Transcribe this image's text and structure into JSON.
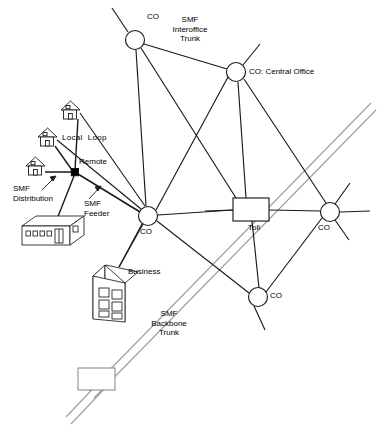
{
  "diagram": {
    "colors": {
      "line": "#1a1a1a",
      "backbone": "#9a9a9a",
      "node_fill": "#ffffff",
      "remote_fill": "#000000",
      "background": "#ffffff",
      "text": "#000000"
    },
    "nodes": [
      {
        "id": "co_top",
        "type": "co-circle",
        "label": "CO",
        "cx": 135,
        "cy": 40,
        "r": 9.5,
        "label_x": 147,
        "label_y": 17,
        "align": "left"
      },
      {
        "id": "co_central",
        "type": "co-circle",
        "label": "CO: Central Office",
        "cx": 236,
        "cy": 72,
        "r": 9.5,
        "label_x": 249,
        "label_y": 67,
        "align": "left"
      },
      {
        "id": "co_left",
        "type": "co-circle",
        "label": "CO",
        "cx": 148,
        "cy": 216,
        "r": 9.5,
        "label_x": 140,
        "label_y": 228,
        "align": "left"
      },
      {
        "id": "co_right",
        "type": "co-circle",
        "label": "CO",
        "cx": 330,
        "cy": 212,
        "r": 9.5,
        "label_x": 322,
        "label_y": 224,
        "align": "left"
      },
      {
        "id": "co_bottom",
        "type": "co-circle",
        "label": "CO",
        "cx": 258,
        "cy": 297,
        "r": 9.5,
        "label_x": 270,
        "label_y": 292,
        "align": "left"
      },
      {
        "id": "toll",
        "type": "toll-box",
        "label": "Toll",
        "x": 233,
        "y": 198,
        "w": 36,
        "h": 23,
        "label_x": 248,
        "label_y": 224,
        "align": "left"
      },
      {
        "id": "remote",
        "type": "remote-dot",
        "label": "Remote",
        "cx": 75,
        "cy": 172,
        "r": 3.6,
        "label_x": 78,
        "label_y": 158,
        "align": "left"
      },
      {
        "id": "end_box",
        "type": "plain-box",
        "label": "",
        "x": 78,
        "y": 368,
        "w": 37,
        "h": 22,
        "label_x": 0,
        "label_y": 0,
        "align": "left"
      }
    ],
    "customer_premises": [
      {
        "id": "house_top",
        "type": "house",
        "x": 61,
        "y": 102,
        "w": 19,
        "h": 17
      },
      {
        "id": "house_middle",
        "type": "house",
        "x": 38,
        "y": 129,
        "w": 19,
        "h": 17
      },
      {
        "id": "house_bottom",
        "type": "house",
        "x": 26,
        "y": 158,
        "w": 19,
        "h": 17
      },
      {
        "id": "distribution_building",
        "type": "building",
        "x": 22,
        "y": 215,
        "w": 62,
        "h": 30
      },
      {
        "id": "business_building",
        "type": "office",
        "x": 93,
        "y": 264,
        "w": 45,
        "h": 58
      }
    ],
    "labels": [
      {
        "id": "label-smf-interoffice-trunk",
        "text": "SMF\nInteroffice\nTrunk",
        "x": 172,
        "y": 18,
        "align": "center",
        "width": 60
      },
      {
        "id": "label-local-loop",
        "text": "Local  Loop",
        "x": 62,
        "y": 136,
        "align": "left",
        "width": 70
      },
      {
        "id": "label-smf-distribution",
        "text": "SMF\nDistribution",
        "x": 14,
        "y": 186,
        "align": "left",
        "width": 62
      },
      {
        "id": "label-smf-feeder",
        "text": "SMF\nFeeder",
        "x": 83,
        "y": 199,
        "align": "left",
        "width": 42
      },
      {
        "id": "label-business",
        "text": "Business",
        "x": 127,
        "y": 268,
        "align": "left",
        "width": 48
      },
      {
        "id": "label-smf-backbone-trunk",
        "text": "SMF\nBackbone\nTrunk",
        "x": 151,
        "y": 310,
        "align": "center",
        "width": 58
      }
    ],
    "legend_note": "CO: Central Office",
    "link_types": [
      {
        "name": "SMF Interoffice Trunk",
        "style": "solid-black"
      },
      {
        "name": "Local Loop",
        "style": "solid-black"
      },
      {
        "name": "SMF Distribution",
        "style": "solid-black"
      },
      {
        "name": "SMF Feeder",
        "style": "solid-black"
      },
      {
        "name": "SMF Backbone Trunk",
        "style": "double-gray"
      }
    ]
  }
}
